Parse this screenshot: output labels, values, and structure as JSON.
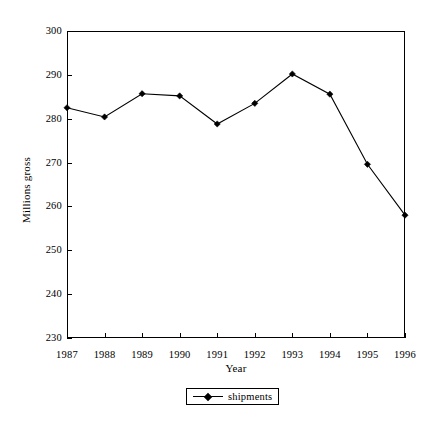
{
  "chart_data": {
    "type": "line",
    "title": "",
    "subtitle": "",
    "xlabel": "Year",
    "ylabel": "Millions gross",
    "categories": [
      "1987",
      "1988",
      "1989",
      "1990",
      "1991",
      "1992",
      "1993",
      "1994",
      "1995",
      "1996"
    ],
    "series": [
      {
        "name": "shipments",
        "values": [
          282.5,
          280.4,
          285.7,
          285.2,
          278.8,
          283.5,
          290.2,
          285.6,
          269.6,
          258.0
        ],
        "color": "#000000",
        "marker": "diamond"
      }
    ],
    "ylim": [
      230,
      300
    ],
    "yticks": [
      230,
      240,
      250,
      260,
      270,
      280,
      290,
      300
    ],
    "ytick_labels": [
      "230",
      "240",
      "250",
      "260",
      "270",
      "280",
      "290",
      "300"
    ],
    "xtick_labels": [
      "1987",
      "1988",
      "1989",
      "1990",
      "1991",
      "1992",
      "1993",
      "1994",
      "1995",
      "1996"
    ],
    "grid": false,
    "legend_position": "bottom-center",
    "legend_entries": [
      "shipments"
    ],
    "frame": "box",
    "background_color": "#ffffff",
    "axis_color": "#000000"
  }
}
